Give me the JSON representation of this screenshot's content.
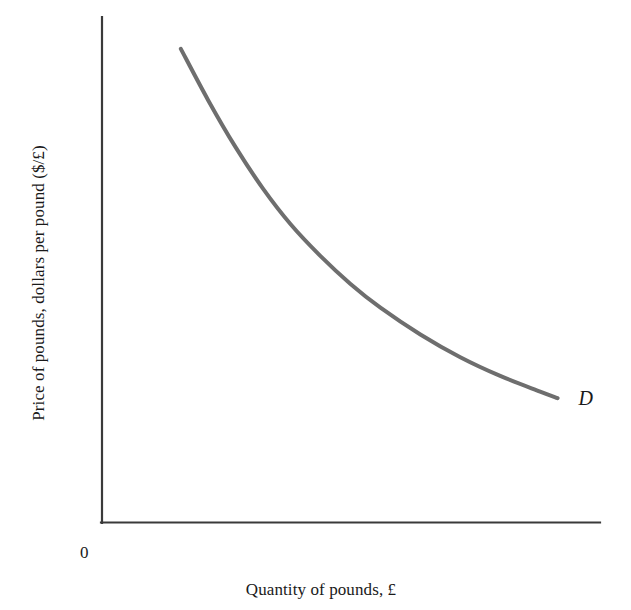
{
  "figure": {
    "background_color": "#ffffff",
    "axis_color": "#3a3a3a",
    "curve_color": "#6e6e6e",
    "text_color": "#1a1a1a"
  },
  "labels": {
    "y_axis": "Price of pounds, dollars per pound ($/£)",
    "x_axis": "Quantity of pounds, £",
    "origin": "0",
    "curve": "D"
  },
  "chart_data": {
    "type": "line",
    "title": "",
    "subtitle": "",
    "xlabel": "Quantity of pounds, £",
    "ylabel": "Price of pounds, dollars per pound ($/£)",
    "grid": false,
    "legend_position": "inline-right-end",
    "axis_style": "open L-shaped axes, no tick marks, no tick labels",
    "xlim": [
      0,
      1
    ],
    "ylim": [
      0,
      1
    ],
    "origin_label": "0",
    "annotations": [
      {
        "text": "D",
        "meaning": "demand curve for pounds",
        "x": 0.935,
        "y": 0.245,
        "style": "italic"
      }
    ],
    "series": [
      {
        "name": "D",
        "label": "D",
        "description": "Downward-sloping, convex-to-origin demand curve for pounds sterling",
        "color": "#6e6e6e",
        "line_width": 4,
        "x": [
          0.16,
          0.215,
          0.27,
          0.325,
          0.38,
          0.44,
          0.5,
          0.56,
          0.64,
          0.72,
          0.8,
          0.88,
          0.915
        ],
        "y": [
          0.937,
          0.835,
          0.742,
          0.66,
          0.59,
          0.527,
          0.472,
          0.425,
          0.372,
          0.327,
          0.29,
          0.259,
          0.246
        ]
      }
    ]
  }
}
